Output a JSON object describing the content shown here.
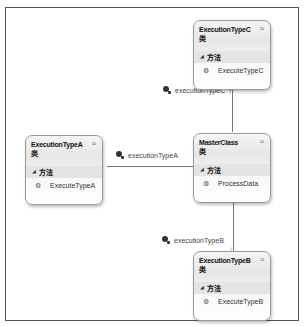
{
  "diagram": {
    "classes": [
      {
        "name": "ExecutionTypeC",
        "kind": "类",
        "section": "方法",
        "members": [
          "ExecuteTypeC"
        ]
      },
      {
        "name": "ExecutionTypeA",
        "kind": "类",
        "section": "方法",
        "members": [
          "ExecuteTypeA"
        ]
      },
      {
        "name": "MasterClass",
        "kind": "类",
        "section": "方法",
        "members": [
          "ProcessData"
        ]
      },
      {
        "name": "ExecutionTypeB",
        "kind": "类",
        "section": "方法",
        "members": [
          "ExecuteTypeB"
        ]
      }
    ],
    "associations": [
      {
        "label": "executionTypeC",
        "from": "MasterClass",
        "to": "ExecutionTypeC"
      },
      {
        "label": "executionTypeA",
        "from": "MasterClass",
        "to": "ExecutionTypeA"
      },
      {
        "label": "executionTypeB",
        "from": "MasterClass",
        "to": "ExecutionTypeB"
      }
    ],
    "collapse_glyph": "≈",
    "section_glyph": "◢",
    "member_glyph": "⚙",
    "arrow_up": "↑",
    "arrow_left": "←",
    "arrow_down": "↓"
  }
}
